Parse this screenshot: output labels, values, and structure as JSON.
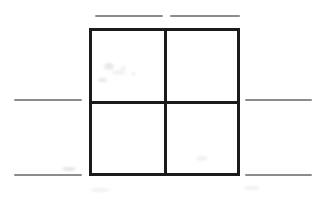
{
  "figure": {
    "title": "",
    "background_color": "#ffffff",
    "width": 316,
    "height": 197
  },
  "square": {
    "label": "2x2 grid square",
    "color": "#1b1b1b",
    "x": 89,
    "y": 28,
    "width": 151,
    "height": 148,
    "border_width": 3,
    "divider_color": "#1b1b1b",
    "divider_width": 3,
    "vertical_divider_x": 164,
    "horizontal_divider_y": 101
  },
  "cells": [
    {
      "name": "top-left-cell",
      "value": ""
    },
    {
      "name": "top-right-cell",
      "value": ""
    },
    {
      "name": "bottom-left-cell",
      "value": ""
    },
    {
      "name": "bottom-right-cell",
      "value": ""
    }
  ],
  "dashes": {
    "color": "#8c8c8c",
    "thickness": 2,
    "items": [
      {
        "name": "dash-top-left",
        "x": 95,
        "y": 15,
        "length": 68
      },
      {
        "name": "dash-top-right",
        "x": 170,
        "y": 15,
        "length": 70
      },
      {
        "name": "dash-middle-left",
        "x": 14,
        "y": 99,
        "length": 68
      },
      {
        "name": "dash-middle-right",
        "x": 245,
        "y": 99,
        "length": 67
      },
      {
        "name": "dash-bottom-left",
        "x": 14,
        "y": 174,
        "length": 68
      },
      {
        "name": "dash-bottom-right",
        "x": 245,
        "y": 174,
        "length": 67
      }
    ]
  },
  "artifacts": [
    {
      "x": 104,
      "y": 63,
      "w": 10,
      "h": 7
    },
    {
      "x": 112,
      "y": 70,
      "w": 14,
      "h": 5
    },
    {
      "x": 120,
      "y": 66,
      "w": 6,
      "h": 5
    },
    {
      "x": 98,
      "y": 78,
      "w": 9,
      "h": 4
    },
    {
      "x": 131,
      "y": 72,
      "w": 5,
      "h": 4
    },
    {
      "x": 196,
      "y": 156,
      "w": 12,
      "h": 5
    },
    {
      "x": 62,
      "y": 167,
      "w": 14,
      "h": 4
    },
    {
      "x": 244,
      "y": 186,
      "w": 16,
      "h": 4
    },
    {
      "x": 90,
      "y": 188,
      "w": 20,
      "h": 4
    }
  ]
}
